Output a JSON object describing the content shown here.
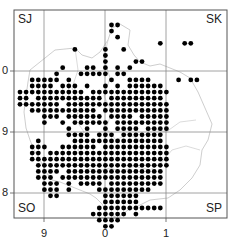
{
  "map": {
    "square_labels": {
      "top_left": "SJ",
      "top_right": "SK",
      "bottom_left": "SO",
      "bottom_right": "SP"
    },
    "y_axis_labels": [
      "0",
      "9",
      "8"
    ],
    "x_axis_labels": [
      "9",
      "0",
      "1"
    ],
    "colors": {
      "dot": "#000000",
      "frame": "#555555",
      "grid": "#888888",
      "boundary": "#c8c8c8"
    },
    "dot_rows": [
      [
        15,
        16
      ],
      [
        15
      ],
      [
        16
      ],
      [
        23,
        27,
        28
      ],
      [
        9,
        14,
        17
      ],
      [
        14
      ],
      [
        14,
        19,
        20
      ],
      [
        7,
        11,
        12,
        14,
        16,
        18
      ],
      [
        6,
        10,
        11,
        12,
        13,
        14,
        16,
        17
      ],
      [
        2,
        3,
        4,
        5,
        6,
        8,
        15,
        18,
        19,
        20,
        21,
        26,
        28,
        29
      ],
      [
        2,
        3,
        4,
        5,
        7,
        8,
        9,
        11,
        14,
        16,
        18,
        19,
        20,
        21,
        22,
        23
      ],
      [
        0,
        1,
        2,
        3,
        4,
        5,
        6,
        7,
        8,
        9,
        10,
        12,
        13,
        14,
        15,
        16,
        17,
        18,
        19,
        20,
        21,
        22,
        23,
        24
      ],
      [
        0,
        1,
        3,
        4,
        5,
        6,
        7,
        8,
        9,
        10,
        11,
        12,
        13,
        15,
        16,
        17,
        18,
        19,
        20,
        21,
        22,
        23
      ],
      [
        0,
        1,
        2,
        3,
        4,
        5,
        6,
        8,
        9,
        10,
        11,
        12,
        13,
        14,
        15,
        16,
        17,
        18,
        19,
        20,
        21,
        22,
        23,
        24
      ],
      [
        2,
        3,
        4,
        5,
        6,
        7,
        8,
        9,
        10,
        11,
        12,
        14,
        15,
        16,
        17,
        18,
        19,
        20,
        21,
        22,
        23,
        24
      ],
      [
        4,
        5,
        6,
        8,
        9,
        10,
        11,
        12,
        13,
        15,
        16,
        17,
        18,
        20,
        21,
        22,
        23,
        24
      ],
      [
        4,
        7,
        9,
        10,
        11,
        12,
        13,
        14,
        16,
        17,
        18,
        19,
        20,
        21,
        22,
        23,
        24
      ],
      [
        8,
        11,
        14,
        16,
        17,
        18,
        19,
        21,
        22,
        23,
        24
      ],
      [
        8,
        9,
        10,
        11,
        13,
        14,
        15,
        17,
        18,
        19,
        20,
        21,
        22,
        23
      ],
      [
        3,
        9,
        10,
        11,
        12,
        13,
        14,
        15,
        16,
        17,
        18,
        19,
        20,
        21,
        22,
        23
      ],
      [
        2,
        3,
        4,
        7,
        8,
        9,
        10,
        11,
        12,
        14,
        15,
        16,
        17,
        18,
        19,
        20,
        21,
        22,
        23,
        24
      ],
      [
        2,
        3,
        5,
        6,
        7,
        8,
        9,
        10,
        11,
        12,
        13,
        14,
        15,
        16,
        17,
        18,
        19,
        20,
        21,
        22,
        23,
        24
      ],
      [
        2,
        3,
        4,
        5,
        6,
        7,
        8,
        9,
        10,
        11,
        12,
        13,
        14,
        15,
        16,
        17,
        18,
        19,
        20,
        21,
        22,
        23,
        24
      ],
      [
        3,
        4,
        5,
        6,
        7,
        8,
        9,
        10,
        11,
        12,
        13,
        14,
        15,
        16,
        17,
        18,
        19,
        20,
        21,
        22,
        23,
        24
      ],
      [
        3,
        4,
        5,
        6,
        8,
        9,
        10,
        11,
        12,
        13,
        14,
        15,
        16,
        17,
        18,
        19,
        20,
        21,
        22,
        23
      ],
      [
        3,
        4,
        5,
        7,
        8,
        9,
        10,
        11,
        12,
        13,
        14,
        15,
        16,
        17,
        18,
        19,
        20,
        21,
        22,
        23
      ],
      [
        4,
        5,
        6,
        8,
        10,
        11,
        12,
        13,
        15,
        16,
        17,
        18,
        19,
        20,
        21,
        22,
        23
      ],
      [
        4,
        5,
        6,
        8,
        13,
        14,
        15,
        16,
        17,
        18,
        19,
        20,
        21
      ],
      [
        5,
        6,
        14,
        15,
        16,
        17,
        18,
        19
      ],
      [
        14,
        15,
        16,
        17,
        18,
        19
      ],
      [
        13,
        14,
        15,
        16,
        17,
        18,
        19,
        20,
        21,
        22,
        23
      ],
      [
        12,
        13,
        14,
        15,
        16,
        17,
        19
      ],
      [
        13,
        14,
        15,
        16
      ],
      [
        14,
        15
      ]
    ]
  }
}
